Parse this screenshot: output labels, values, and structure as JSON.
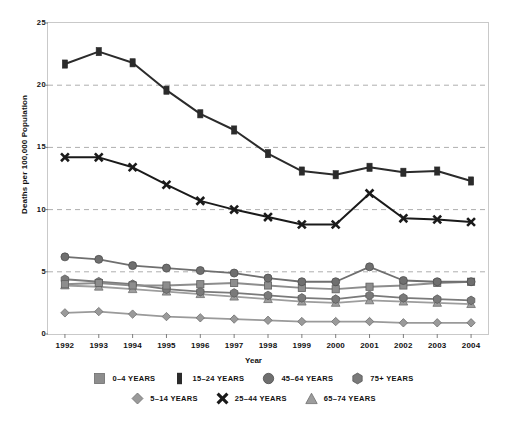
{
  "chart_data": {
    "type": "line",
    "title": "",
    "xlabel": "Year",
    "ylabel": "Deaths per 100,000 Population",
    "categories": [
      1992,
      1993,
      1994,
      1995,
      1996,
      1997,
      1998,
      1999,
      2000,
      2001,
      2002,
      2003,
      2004
    ],
    "xtick_labels": [
      "1992",
      "1993",
      "1994",
      "1995",
      "1996",
      "1997",
      "1998",
      "1999",
      "2000",
      "2001",
      "2002",
      "2003",
      "2004"
    ],
    "ytick_labels": [
      "0",
      "5",
      "10",
      "15",
      "20",
      "25"
    ],
    "yticks": [
      0,
      5,
      10,
      15,
      20,
      25
    ],
    "ylim": [
      0,
      25
    ],
    "grid": "horizontal-dashed",
    "legend_position": "bottom",
    "series": [
      {
        "name": "0–4 YEARS",
        "marker": "square",
        "color": "#8d8d8d",
        "values": [
          4.0,
          4.1,
          3.9,
          3.9,
          4.0,
          4.1,
          3.9,
          3.7,
          3.6,
          3.8,
          3.9,
          4.1,
          4.2
        ]
      },
      {
        "name": "5–14 YEARS",
        "marker": "diamond",
        "color": "#9a9a9a",
        "values": [
          1.7,
          1.8,
          1.6,
          1.4,
          1.3,
          1.2,
          1.1,
          1.0,
          1.0,
          1.0,
          0.9,
          0.9,
          0.9
        ]
      },
      {
        "name": "15–24 YEARS",
        "marker": "square-filled",
        "color": "#2b2b2b",
        "values": [
          21.7,
          22.7,
          21.8,
          19.6,
          17.7,
          16.4,
          14.5,
          13.1,
          12.8,
          13.4,
          13.0,
          13.1,
          12.3
        ]
      },
      {
        "name": "25–44 YEARS",
        "marker": "x",
        "color": "#1a1a1a",
        "values": [
          14.2,
          14.2,
          13.4,
          12.0,
          10.7,
          10.0,
          9.4,
          8.8,
          8.8,
          11.3,
          9.3,
          9.2,
          9.0
        ]
      },
      {
        "name": "45–64 YEARS",
        "marker": "circle",
        "color": "#6f6f6f",
        "values": [
          6.2,
          6.0,
          5.5,
          5.3,
          5.1,
          4.9,
          4.5,
          4.2,
          4.2,
          5.4,
          4.3,
          4.2,
          4.2
        ]
      },
      {
        "name": "65–74 YEARS",
        "marker": "triangle",
        "color": "#9d9d9d",
        "values": [
          3.9,
          3.8,
          3.6,
          3.4,
          3.2,
          3.0,
          2.8,
          2.6,
          2.5,
          2.7,
          2.6,
          2.5,
          2.4
        ]
      },
      {
        "name": "75+ YEARS",
        "marker": "hexagon",
        "color": "#7a7a7a",
        "values": [
          4.4,
          4.2,
          4.0,
          3.6,
          3.4,
          3.3,
          3.1,
          2.9,
          2.8,
          3.1,
          2.9,
          2.8,
          2.7
        ]
      }
    ]
  },
  "legend": {
    "row1": [
      "0–4 YEARS",
      "15–24 YEARS",
      "45–64 YEARS",
      "75+ YEARS"
    ],
    "row2": [
      "5–14 YEARS",
      "25–44 YEARS",
      "65–74 YEARS"
    ]
  }
}
